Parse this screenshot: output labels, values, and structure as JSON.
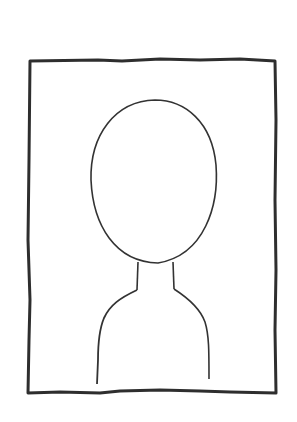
{
  "sketch": {
    "subject": "portrait placeholder",
    "frame": {
      "x": 29,
      "y": 60,
      "width": 246,
      "height": 334
    },
    "stroke_color": "#2e2e2e",
    "background_color": "#ffffff",
    "parts": [
      "frame",
      "head",
      "neck",
      "shoulders"
    ]
  }
}
